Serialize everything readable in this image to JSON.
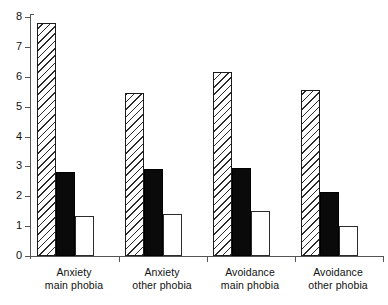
{
  "chart_data": {
    "type": "bar",
    "title": "",
    "subtitle": "",
    "xlabel": "",
    "ylabel": "",
    "ylim": [
      0,
      8
    ],
    "yticks": [
      0,
      1,
      2,
      3,
      4,
      5,
      6,
      7,
      8
    ],
    "ytick_labels": [
      "0",
      "1",
      "2",
      "3",
      "4",
      "5",
      "6",
      "7",
      "8"
    ],
    "grid": false,
    "legend": "none",
    "categories": [
      "Anxiety main phobia",
      "Anxiety other phobia",
      "Avoidance main phobia",
      "Avoidance other phobia"
    ],
    "category_lines": [
      {
        "line1": "Anxiety",
        "line2": "main phobia"
      },
      {
        "line1": "Anxiety",
        "line2": "other phobia"
      },
      {
        "line1": "Avoidance",
        "line2": "main phobia"
      },
      {
        "line1": "Avoidance",
        "line2": "other phobia"
      }
    ],
    "series": [
      {
        "name": "hatched",
        "style": "hatched",
        "values": [
          7.8,
          5.45,
          6.15,
          5.55
        ]
      },
      {
        "name": "solid-black",
        "style": "filled",
        "values": [
          2.8,
          2.9,
          2.95,
          2.15
        ]
      },
      {
        "name": "open-white",
        "style": "open",
        "values": [
          1.35,
          1.4,
          1.5,
          1.0
        ]
      }
    ],
    "colors": {
      "hatch_line": "#2b2b2b",
      "hatch_fill": "#ffffff",
      "solid_fill": "#0a0a0a",
      "open_fill": "#ffffff",
      "axis": "#555555",
      "text": "#111111"
    }
  }
}
